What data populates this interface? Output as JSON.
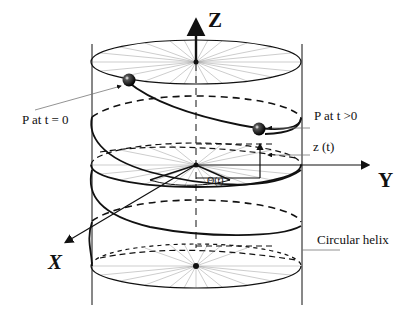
{
  "diagram": {
    "axes": {
      "z_label": "Z",
      "y_label": "Y",
      "x_label": "X"
    },
    "annotations": {
      "p_initial": "P at t = 0",
      "p_later": "P at t >0",
      "z_of_t": "z (t)",
      "theta_of_t": "Θ(t)",
      "helix": "Circular helix"
    },
    "colors": {
      "ink": "#111111",
      "spoke": "#9a9a9a",
      "background": "#ffffff"
    }
  }
}
